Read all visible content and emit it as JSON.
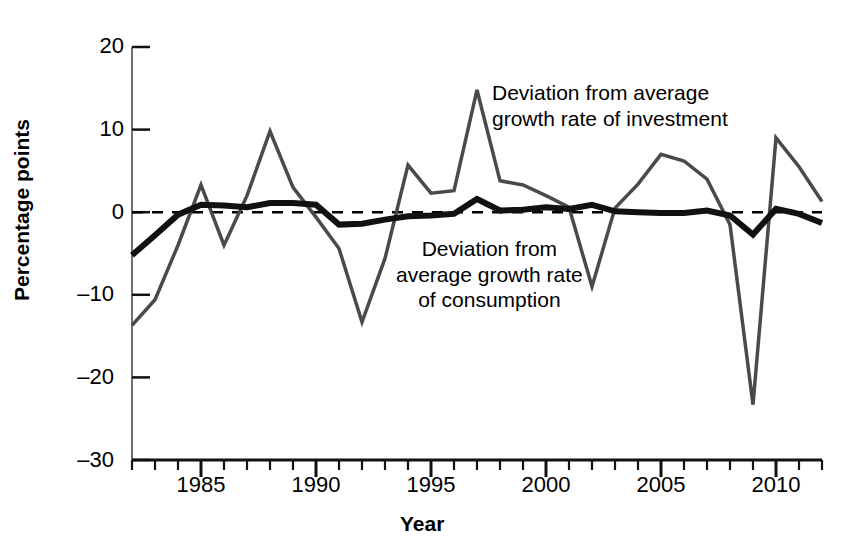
{
  "chart_data": {
    "type": "line",
    "title": "",
    "xlabel": "Year",
    "ylabel": "Percentage points",
    "xlim": [
      1982,
      2012
    ],
    "ylim": [
      -30,
      20
    ],
    "yticks": [
      20,
      10,
      0,
      -10,
      -20,
      -30
    ],
    "ytick_labels": [
      "20",
      "10",
      "0",
      "–10",
      "–20",
      "–30"
    ],
    "xticks": [
      1985,
      1990,
      1995,
      2000,
      2005,
      2010
    ],
    "xtick_labels": [
      "1985",
      "1990",
      "1995",
      "2000",
      "2005",
      "2010"
    ],
    "xminor_step": 1,
    "grid": false,
    "zero_line": true,
    "zero_line_style": "dashed",
    "legend_position": "inline-annotations",
    "x": [
      1982,
      1983,
      1984,
      1985,
      1986,
      1987,
      1988,
      1989,
      1990,
      1991,
      1992,
      1993,
      1994,
      1995,
      1996,
      1997,
      1998,
      1999,
      2000,
      2001,
      2002,
      2003,
      2004,
      2005,
      2006,
      2007,
      2008,
      2009,
      2010,
      2011,
      2012
    ],
    "series": [
      {
        "name": "Deviation from average growth rate of investment",
        "color": "#4a4a4a",
        "width": 3.5,
        "values": [
          -13.7,
          -10.6,
          -4.0,
          3.3,
          -4.0,
          2.0,
          9.8,
          3.0,
          -0.6,
          -4.4,
          -13.3,
          -5.6,
          5.7,
          2.3,
          2.6,
          14.8,
          3.8,
          3.3,
          2.0,
          0.6,
          -9.0,
          0.5,
          3.4,
          7.0,
          6.2,
          4.0,
          -1.5,
          -23.3,
          9.0,
          5.5,
          1.3
        ]
      },
      {
        "name": "Deviation from average growth rate of consumption",
        "color": "#111111",
        "width": 6.0,
        "values": [
          -5.2,
          -2.8,
          -0.3,
          0.9,
          0.8,
          0.6,
          1.1,
          1.1,
          0.9,
          -1.5,
          -1.4,
          -0.9,
          -0.5,
          -0.4,
          -0.2,
          1.6,
          0.2,
          0.3,
          0.6,
          0.4,
          0.9,
          0.1,
          0.0,
          -0.1,
          -0.1,
          0.2,
          -0.4,
          -2.7,
          0.4,
          -0.2,
          -1.3
        ]
      }
    ],
    "annotations": [
      {
        "id": "investment",
        "text": "Deviation from average\ngrowth rate of investment"
      },
      {
        "id": "consumption",
        "text": "Deviation from\naverage growth rate\nof consumption"
      }
    ]
  }
}
